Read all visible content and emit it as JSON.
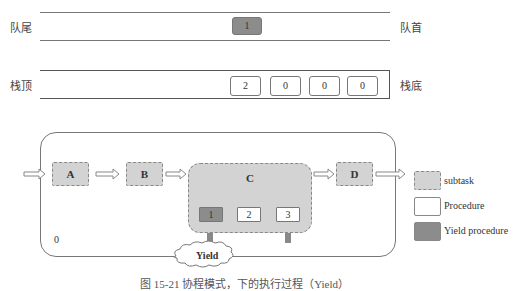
{
  "queue": {
    "tail_label": "队尾",
    "head_label": "队首",
    "items": [
      {
        "value": "1",
        "type": "yield"
      }
    ]
  },
  "stack": {
    "top_label": "栈顶",
    "bottom_label": "栈底",
    "items": [
      "2",
      "0",
      "0",
      "0"
    ]
  },
  "flow": {
    "tasks": [
      {
        "id": "A",
        "label": "A"
      },
      {
        "id": "B",
        "label": "B"
      },
      {
        "id": "C",
        "label": "C"
      },
      {
        "id": "D",
        "label": "D"
      }
    ],
    "procedures": [
      {
        "label": "1",
        "type": "yield"
      },
      {
        "label": "2",
        "type": "normal"
      },
      {
        "label": "3",
        "type": "normal"
      }
    ],
    "corner_label": "0",
    "cloud_label": "Yield"
  },
  "legend": {
    "items": [
      {
        "label": "subtask",
        "color": "#d3d3d3"
      },
      {
        "label": "Procedure",
        "color": "#ffffff"
      },
      {
        "label": "Yield procedure",
        "color": "#8c8c8c"
      }
    ]
  },
  "caption": "图 15-21  协程模式，下的执行过程（Yield）"
}
